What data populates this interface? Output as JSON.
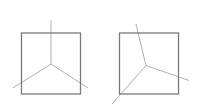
{
  "diagram": {
    "colors": {
      "square": "#7a7a7a",
      "lines": "#b0b0b0",
      "background": "#ffffff"
    },
    "panels": [
      {
        "name": "left",
        "square": {
          "x": 21.5,
          "y": 33,
          "w": 59,
          "h": 61
        },
        "center": [
          51,
          64
        ],
        "rays": [
          [
            51,
            20
          ],
          [
            13,
            88
          ],
          [
            88,
            88
          ]
        ]
      },
      {
        "name": "right",
        "square": {
          "x": 119.5,
          "y": 33,
          "w": 59,
          "h": 61
        },
        "center": [
          146,
          65.5
        ],
        "rays": [
          [
            136,
            24
          ],
          [
            189,
            80.5
          ],
          [
            112,
            104
          ]
        ]
      }
    ]
  }
}
